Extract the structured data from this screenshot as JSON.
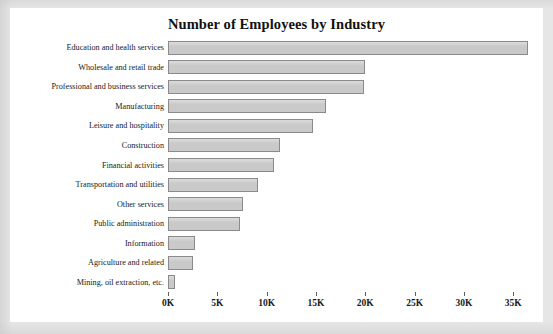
{
  "panel": {
    "background_color": "#ffffff",
    "page_background_color": "#e6e6e6"
  },
  "chart_data": {
    "type": "bar",
    "orientation": "horizontal",
    "title": "Number of Employees by Industry",
    "xlabel": "",
    "ylabel": "",
    "xlim": [
      0,
      37000
    ],
    "grid": false,
    "legend": null,
    "bar_color": "#c9c9c9",
    "bar_edge_color": "#8a8a8a",
    "xtick_labels": [
      "0K",
      "5K",
      "10K",
      "15K",
      "20K",
      "25K",
      "30K",
      "35K"
    ],
    "xtick_values": [
      0,
      5000,
      10000,
      15000,
      20000,
      25000,
      30000,
      35000
    ],
    "categories": [
      "Education and health services",
      "Wholesale and retail trade",
      "Professional and business services",
      "Manufacturing",
      "Leisure and hospitality",
      "Construction",
      "Financial activities",
      "Transportation and utilities",
      "Other services",
      "Public administration",
      "Information",
      "Agriculture and related",
      "Mining, oil extraction, etc."
    ],
    "values": [
      36500,
      20000,
      19900,
      16000,
      14700,
      11400,
      10700,
      9100,
      7600,
      7300,
      2700,
      2500,
      700
    ]
  }
}
